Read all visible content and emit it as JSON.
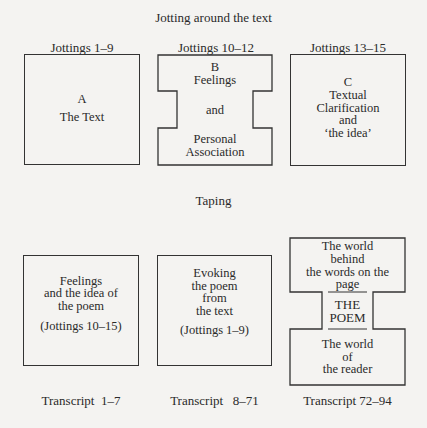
{
  "section1": {
    "title": "Jotting around the text",
    "columns": [
      {
        "heading": "Jottings 1–9",
        "letter": "A",
        "lines": [
          "The Text"
        ]
      },
      {
        "heading": "Jottings 10–12",
        "letter": "B",
        "lines": [
          "Feelings",
          "and",
          "Personal",
          "Association"
        ]
      },
      {
        "heading": "Jottings 13–15",
        "letter": "C",
        "lines": [
          "Textual",
          "Clarification",
          "and",
          "‘the idea’"
        ]
      }
    ]
  },
  "section2": {
    "title": "Taping",
    "columns": [
      {
        "lines": [
          "Feelings",
          "and the idea of",
          "the poem"
        ],
        "ref": "(Jottings 10–15)",
        "caption": "Transcript  1–7"
      },
      {
        "lines": [
          "Evoking",
          "the poem",
          "from",
          "the text"
        ],
        "ref": "(Jottings 1–9)",
        "caption": "Transcript   8–71"
      },
      {
        "top_lines": [
          "The world",
          "behind",
          "the words on the",
          "page"
        ],
        "center_lines": [
          "THE",
          "POEM"
        ],
        "bottom_lines": [
          "The world",
          "of",
          "the reader"
        ],
        "caption": "Transcript 72–94"
      }
    ]
  }
}
